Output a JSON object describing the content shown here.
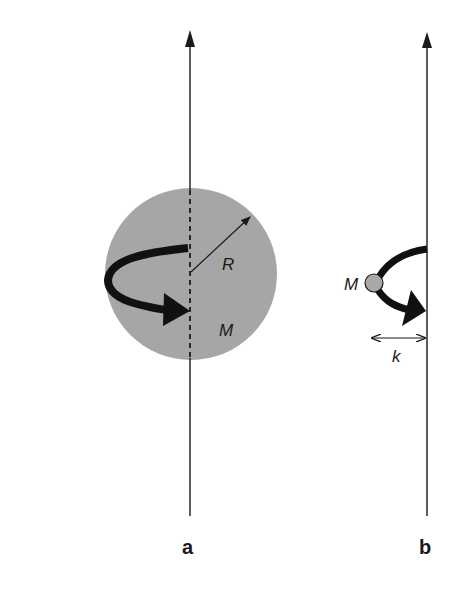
{
  "figure": {
    "panels": [
      {
        "id": "a",
        "label": "a",
        "axis_x": 190,
        "sphere": {
          "cx": 191,
          "cy": 274,
          "r": 86,
          "color": "#a6a6a6"
        },
        "radius_label": "R",
        "mass_label": "M"
      },
      {
        "id": "b",
        "label": "b",
        "axis_x": 427,
        "point_mass": {
          "cx": 374,
          "cy": 283,
          "r": 9,
          "color": "#a8a8a8"
        },
        "mass_label": "M",
        "distance_label": "k"
      }
    ],
    "colors": {
      "ink": "#1a1a1a",
      "sphere": "#a6a6a6",
      "background": "#ffffff"
    }
  }
}
